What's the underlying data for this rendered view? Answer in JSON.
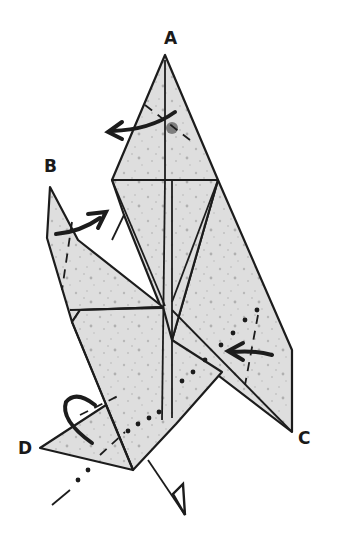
{
  "diagram": {
    "labels": {
      "a": "A",
      "b": "B",
      "c": "C",
      "d": "D"
    },
    "colors": {
      "paper": "#dcdcdc",
      "line": "#1c1c1c",
      "background": "#ffffff"
    },
    "symbols": [
      {
        "name": "valley-fold-arrow",
        "near": "A"
      },
      {
        "name": "valley-fold-arrow",
        "near": "B"
      },
      {
        "name": "push-in-arrow",
        "near": "C"
      },
      {
        "name": "mountain-fold-loop-arrow",
        "near": "D"
      },
      {
        "name": "hollow-arrow",
        "near": "bottom"
      }
    ]
  }
}
